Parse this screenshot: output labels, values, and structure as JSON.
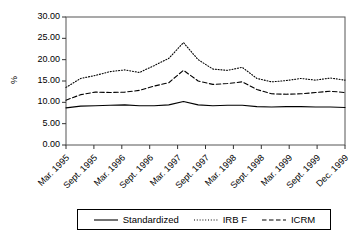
{
  "chart_data": {
    "type": "line",
    "title": "",
    "xlabel": "",
    "ylabel": "%",
    "ylim": [
      0,
      30
    ],
    "ytick_step": 5,
    "grid": false,
    "legend_position": "bottom",
    "ytick_labels": [
      "0.00",
      "5.00",
      "10.00",
      "15.00",
      "20.00",
      "25.00",
      "30.00"
    ],
    "ytick_values": [
      0,
      5,
      10,
      15,
      20,
      25,
      30
    ],
    "xtick_labels": [
      "Mar. 1995",
      "Sept. 1995",
      "Mar. 1996",
      "Sept. 1996",
      "Mar. 1997",
      "Sept. 1997",
      "Mar. 1998",
      "Sept. 1998",
      "Mar. 1999",
      "Sept. 1999",
      "Dec. 1999"
    ],
    "x": [
      "Mar. 1995",
      "Jun. 1995",
      "Sept. 1995",
      "Dec. 1995",
      "Mar. 1996",
      "Jun. 1996",
      "Sept. 1996",
      "Dec. 1996",
      "Mar. 1997",
      "Jun. 1997",
      "Sept. 1997",
      "Dec. 1997",
      "Mar. 1998",
      "Jun. 1998",
      "Sept. 1998",
      "Dec. 1998",
      "Mar. 1999",
      "Jun. 1999",
      "Sept. 1999",
      "Dec. 1999"
    ],
    "series": [
      {
        "name": "Standardized",
        "style": "solid",
        "color": "#000000",
        "values": [
          8.7,
          9.1,
          9.2,
          9.3,
          9.4,
          9.2,
          9.2,
          9.4,
          10.2,
          9.4,
          9.2,
          9.3,
          9.3,
          9.0,
          8.9,
          9.0,
          9.0,
          8.9,
          8.9,
          8.8
        ]
      },
      {
        "name": "IRB F",
        "style": "dotted",
        "color": "#000000",
        "values": [
          13.5,
          15.6,
          16.3,
          17.2,
          17.6,
          17.0,
          18.6,
          20.3,
          24.0,
          20.0,
          17.8,
          17.5,
          18.2,
          15.6,
          14.8,
          15.1,
          15.6,
          15.2,
          15.7,
          15.2
        ]
      },
      {
        "name": "ICRM",
        "style": "dashed",
        "color": "#000000",
        "values": [
          10.5,
          11.8,
          12.4,
          12.3,
          12.4,
          12.8,
          13.8,
          14.6,
          17.5,
          15.0,
          14.2,
          14.4,
          14.8,
          13.0,
          12.0,
          11.9,
          12.0,
          12.3,
          12.6,
          12.3
        ]
      }
    ]
  },
  "legend": {
    "entries": [
      {
        "label": "Standardized",
        "style": "solid"
      },
      {
        "label": "IRB F",
        "style": "dotted"
      },
      {
        "label": "ICRM",
        "style": "dashed"
      }
    ]
  }
}
